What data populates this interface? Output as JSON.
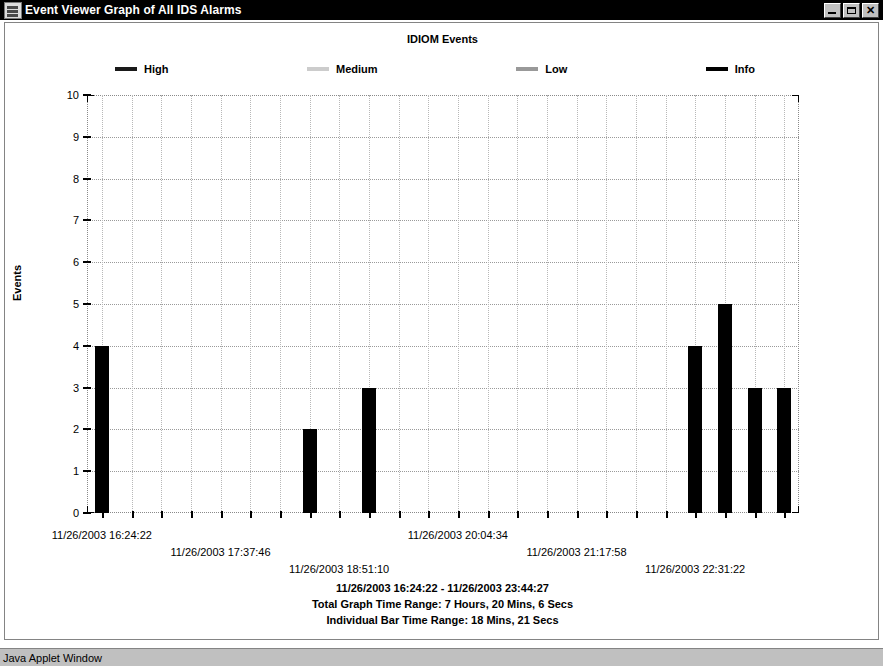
{
  "window": {
    "title": "Event Viewer Graph of All IDS Alarms",
    "icon": "app-icon",
    "minimize_label": "Minimize",
    "maximize_label": "Maximize",
    "close_label": "✕"
  },
  "statusbar": {
    "text": "Java Applet Window"
  },
  "footer": {
    "lines": [
      "11/26/2003 16:24:22 - 11/26/2003 23:44:27",
      "Total Graph Time Range: 7 Hours, 20 Mins, 6 Secs",
      "Individual Bar Time Range: 18 Mins, 21 Secs"
    ]
  },
  "colors": {
    "high": "#1a1a1a",
    "medium": "#cccccc",
    "low": "#999999",
    "info": "#000000",
    "grid": "#9a9a9a",
    "axis": "#000000",
    "titlebar": "#000000",
    "statusbar": "#c0c0c0"
  },
  "chart_data": {
    "type": "bar",
    "title": "IDIOM Events",
    "xlabel": "",
    "ylabel": "Events",
    "ylim": [
      0,
      10
    ],
    "yticks": [
      0,
      1,
      2,
      3,
      4,
      5,
      6,
      7,
      8,
      9,
      10
    ],
    "grid": true,
    "legend_position": "top",
    "legend": [
      {
        "name": "High",
        "color": "#1a1a1a"
      },
      {
        "name": "Medium",
        "color": "#cccccc"
      },
      {
        "name": "Low",
        "color": "#999999"
      },
      {
        "name": "Info",
        "color": "#000000"
      }
    ],
    "x_tick_labels": [
      "11/26/2003 16:24:22",
      "11/26/2003 17:37:46",
      "11/26/2003 18:51:10",
      "11/26/2003 20:04:34",
      "11/26/2003 21:17:58",
      "11/26/2003 22:31:22"
    ],
    "x_tick_slots": [
      1,
      5,
      9,
      13,
      17,
      21
    ],
    "n_slots": 24,
    "series": [
      {
        "name": "Info",
        "color": "#000000",
        "values": [
          4,
          0,
          0,
          0,
          0,
          0,
          0,
          2,
          0,
          3,
          0,
          0,
          0,
          0,
          0,
          0,
          0,
          0,
          0,
          0,
          4,
          5,
          3,
          3
        ]
      }
    ],
    "bars": [
      {
        "slot": 1,
        "value": 4
      },
      {
        "slot": 8,
        "value": 2
      },
      {
        "slot": 10,
        "value": 3
      },
      {
        "slot": 21,
        "value": 4
      },
      {
        "slot": 22,
        "value": 5
      },
      {
        "slot": 23,
        "value": 3
      },
      {
        "slot": 24,
        "value": 3
      }
    ]
  }
}
